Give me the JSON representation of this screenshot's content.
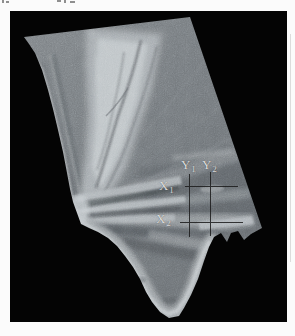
{
  "figure": {
    "colors": {
      "page": "#fbfbfb",
      "figure_background": "#040404",
      "swath_base_gray": "#71767a",
      "swath_bright_gray": "#c4cacd",
      "swath_dark_gray": "#3f4448",
      "annotation_label_color": "#dcdcdc",
      "annotation_line_color": "#1b1b1b"
    },
    "annotations": {
      "labels": [
        {
          "id": "y1",
          "base": "Y",
          "sub": "1"
        },
        {
          "id": "y2",
          "base": "Y",
          "sub": "2"
        },
        {
          "id": "x1",
          "base": "X",
          "sub": "1"
        },
        {
          "id": "x2",
          "base": "X",
          "sub": "2"
        }
      ]
    }
  }
}
